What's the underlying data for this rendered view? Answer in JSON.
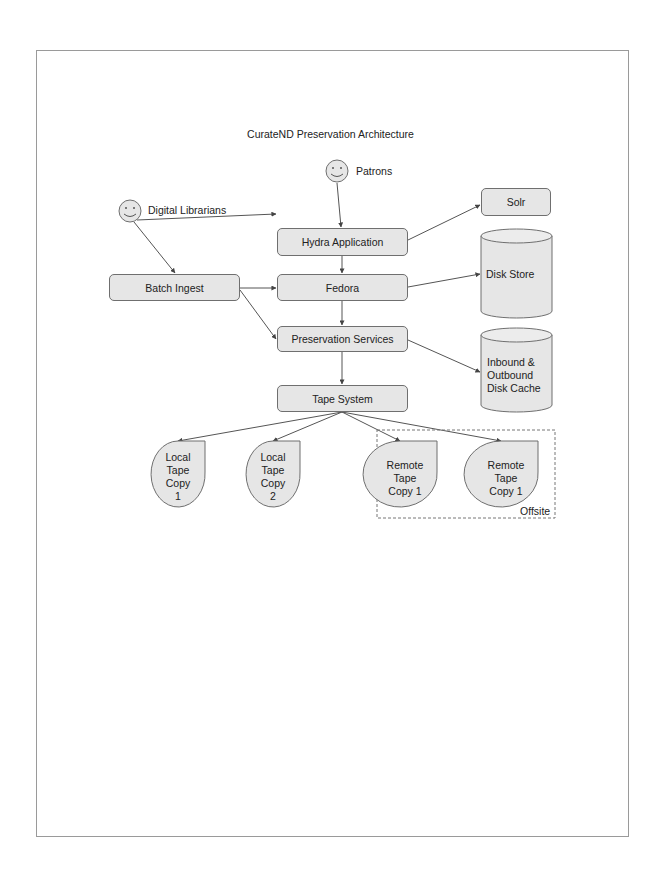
{
  "diagram": {
    "title": "CurateND Preservation Architecture",
    "actors": [
      {
        "id": "patrons",
        "label": "Patrons",
        "icon": "smiley-icon"
      },
      {
        "id": "digital-librarians",
        "label": "Digital Librarians",
        "icon": "smiley-icon"
      }
    ],
    "components": {
      "hydra": "Hydra Application",
      "fedora": "Fedora",
      "batch_ingest": "Batch Ingest",
      "preservation": "Preservation Services",
      "tape_system": "Tape System",
      "solr": "Solr"
    },
    "storage": {
      "disk_store": "Disk Store",
      "cache_line1": "Inbound &",
      "cache_line2": "Outbound",
      "cache_line3": "Disk Cache"
    },
    "tapes": [
      {
        "lines": [
          "Local",
          "Tape",
          "Copy",
          "1"
        ]
      },
      {
        "lines": [
          "Local",
          "Tape",
          "Copy",
          "2"
        ]
      },
      {
        "lines": [
          "Remote",
          "Tape",
          "Copy 1"
        ]
      },
      {
        "lines": [
          "Remote",
          "Tape",
          "Copy 1"
        ]
      }
    ],
    "group_label": "Offsite",
    "edges": [
      {
        "from": "Patrons",
        "to": "Hydra Application"
      },
      {
        "from": "Digital Librarians",
        "to": "Hydra Application"
      },
      {
        "from": "Digital Librarians",
        "to": "Batch Ingest"
      },
      {
        "from": "Hydra Application",
        "to": "Solr"
      },
      {
        "from": "Hydra Application",
        "to": "Fedora"
      },
      {
        "from": "Batch Ingest",
        "to": "Fedora"
      },
      {
        "from": "Batch Ingest",
        "to": "Preservation Services"
      },
      {
        "from": "Fedora",
        "to": "Disk Store"
      },
      {
        "from": "Fedora",
        "to": "Preservation Services"
      },
      {
        "from": "Preservation Services",
        "to": "Inbound & Outbound Disk Cache"
      },
      {
        "from": "Preservation Services",
        "to": "Tape System"
      },
      {
        "from": "Tape System",
        "to": "Local Tape Copy 1"
      },
      {
        "from": "Tape System",
        "to": "Local Tape Copy 2"
      },
      {
        "from": "Tape System",
        "to": "Remote Tape Copy 1"
      },
      {
        "from": "Tape System",
        "to": "Remote Tape Copy 1"
      }
    ],
    "colors": {
      "fill": "#e6e6e6",
      "stroke": "#6f6f6f",
      "line": "#555555",
      "border": "#9a9a9a"
    }
  }
}
